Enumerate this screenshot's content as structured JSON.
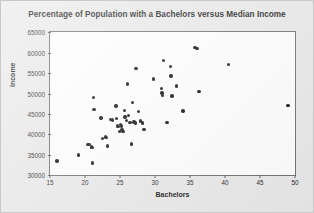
{
  "chart_data": {
    "type": "scatter",
    "title": "Percentage of Population with a Bachelors versus Median Income",
    "xlabel": "Bachelors",
    "ylabel": "Income",
    "xlim": [
      15,
      50
    ],
    "ylim": [
      30000,
      65000
    ],
    "xticks": [
      15,
      20,
      25,
      30,
      35,
      40,
      45,
      50
    ],
    "yticks": [
      30000,
      35000,
      40000,
      45000,
      50000,
      55000,
      60000,
      65000
    ],
    "grid": false,
    "legend": null,
    "marker": "filled-circle",
    "marker_color": "#111111",
    "points": [
      {
        "x": 16.0,
        "y": 33400
      },
      {
        "x": 19.1,
        "y": 34900
      },
      {
        "x": 20.4,
        "y": 37500
      },
      {
        "x": 20.6,
        "y": 37400
      },
      {
        "x": 20.9,
        "y": 36900
      },
      {
        "x": 21.0,
        "y": 36800
      },
      {
        "x": 21.1,
        "y": 32900
      },
      {
        "x": 21.2,
        "y": 49000
      },
      {
        "x": 21.3,
        "y": 46100
      },
      {
        "x": 22.3,
        "y": 44000
      },
      {
        "x": 22.5,
        "y": 39000
      },
      {
        "x": 22.9,
        "y": 39300
      },
      {
        "x": 23.1,
        "y": 39200
      },
      {
        "x": 23.2,
        "y": 37100
      },
      {
        "x": 23.6,
        "y": 43600
      },
      {
        "x": 23.9,
        "y": 43500
      },
      {
        "x": 24.4,
        "y": 46900
      },
      {
        "x": 24.5,
        "y": 43900
      },
      {
        "x": 24.6,
        "y": 42100
      },
      {
        "x": 24.7,
        "y": 41800
      },
      {
        "x": 24.9,
        "y": 40700
      },
      {
        "x": 25.1,
        "y": 42300
      },
      {
        "x": 25.2,
        "y": 42000
      },
      {
        "x": 25.3,
        "y": 41000
      },
      {
        "x": 25.4,
        "y": 40600
      },
      {
        "x": 25.6,
        "y": 45800
      },
      {
        "x": 25.7,
        "y": 44200
      },
      {
        "x": 25.9,
        "y": 43400
      },
      {
        "x": 26.1,
        "y": 52300
      },
      {
        "x": 26.2,
        "y": 44600
      },
      {
        "x": 26.4,
        "y": 42900
      },
      {
        "x": 26.6,
        "y": 37600
      },
      {
        "x": 26.8,
        "y": 47800
      },
      {
        "x": 27.0,
        "y": 43000
      },
      {
        "x": 27.2,
        "y": 42700
      },
      {
        "x": 27.3,
        "y": 56000
      },
      {
        "x": 27.6,
        "y": 45500
      },
      {
        "x": 27.9,
        "y": 43200
      },
      {
        "x": 28.2,
        "y": 42700
      },
      {
        "x": 28.4,
        "y": 41200
      },
      {
        "x": 29.8,
        "y": 53500
      },
      {
        "x": 30.9,
        "y": 51200
      },
      {
        "x": 31.0,
        "y": 50100
      },
      {
        "x": 31.1,
        "y": 49500
      },
      {
        "x": 31.2,
        "y": 58000
      },
      {
        "x": 31.7,
        "y": 42900
      },
      {
        "x": 32.2,
        "y": 56600
      },
      {
        "x": 32.3,
        "y": 54200
      },
      {
        "x": 32.4,
        "y": 49300
      },
      {
        "x": 33.1,
        "y": 51800
      },
      {
        "x": 34.0,
        "y": 45700
      },
      {
        "x": 35.7,
        "y": 61200
      },
      {
        "x": 36.0,
        "y": 61000
      },
      {
        "x": 36.3,
        "y": 50500
      },
      {
        "x": 40.5,
        "y": 57000
      },
      {
        "x": 49.0,
        "y": 47000
      }
    ]
  }
}
